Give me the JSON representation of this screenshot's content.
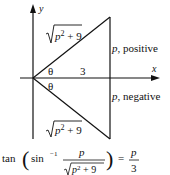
{
  "diagram": {
    "axes": {
      "x_label": "x",
      "y_label": "y"
    },
    "triangle_upper": {
      "hypotenuse_label_radicand": "p² + 9",
      "angle_label": "θ",
      "adjacent_label": "3",
      "opposite_label": "p, positive"
    },
    "triangle_lower": {
      "hypotenuse_label_radicand": "p² + 9",
      "angle_label": "θ",
      "opposite_label": "p, negative"
    },
    "equation": {
      "func": "tan",
      "inner_func": "sin",
      "inverse_sup": "−1",
      "numerator": "p",
      "denominator_radicand": "p² + 9",
      "equals": "=",
      "rhs_numerator": "p",
      "rhs_denominator": "3"
    }
  }
}
